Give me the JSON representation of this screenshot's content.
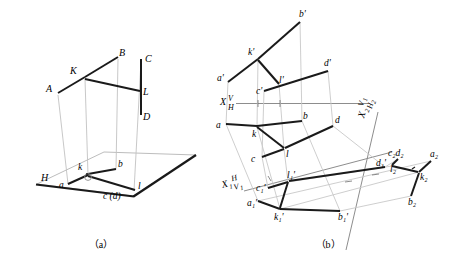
{
  "figure": {
    "type": "descriptive-geometry-projection-drawing",
    "caption_a": "（a）",
    "caption_b": "（b）",
    "bottom_caption": ""
  },
  "colors": {
    "heavy_line": "#1a1a1a",
    "thin_line": "#9a9a9a",
    "axis_line": "#8d8d8d",
    "plane_edge": "#b4b4b4",
    "text": "#1a1a1a"
  },
  "panel_a": {
    "name": "pictorial-view",
    "plane_label": "H",
    "space_points": [
      {
        "id": "A",
        "label": "A",
        "x": 52,
        "y": 88
      },
      {
        "id": "B",
        "label": "B",
        "x": 121,
        "y": 58
      },
      {
        "id": "K",
        "label": "K",
        "x": 77,
        "y": 73
      },
      {
        "id": "C",
        "label": "C",
        "x": 148,
        "y": 61
      },
      {
        "id": "L",
        "label": "L",
        "x": 145,
        "y": 92
      },
      {
        "id": "D",
        "label": "D",
        "x": 148,
        "y": 118
      }
    ],
    "space_segments": [
      {
        "name": "AK",
        "x1": 58,
        "y1": 93,
        "x2": 85,
        "y2": 77
      },
      {
        "name": "KB",
        "x1": 85,
        "y1": 77,
        "x2": 118,
        "y2": 57
      },
      {
        "name": "KL",
        "x1": 85,
        "y1": 79,
        "x2": 140,
        "y2": 91
      },
      {
        "name": "CD",
        "x1": 141,
        "y1": 59,
        "x2": 141,
        "y2": 115
      }
    ],
    "h_plane": {
      "pts": "37,184 104,152 196,155 133,196",
      "bottom_edge": "37,184 133,196"
    },
    "proj_points": [
      {
        "id": "a",
        "label": "a",
        "x": 64,
        "y": 185
      },
      {
        "id": "k",
        "label": "k",
        "x": 81,
        "y": 172
      },
      {
        "id": "b",
        "label": "b",
        "x": 119,
        "y": 168
      },
      {
        "id": "l",
        "label": "l",
        "x": 141,
        "y": 188
      },
      {
        "id": "cd",
        "label": "c (d)",
        "x": 113,
        "y": 198
      }
    ],
    "proj_segments": [
      {
        "name": "ak",
        "x1": 68,
        "y1": 184,
        "x2": 88,
        "y2": 175
      },
      {
        "name": "kb",
        "x1": 88,
        "y1": 174,
        "x2": 116,
        "y2": 169
      },
      {
        "name": "kl",
        "x1": 88,
        "y1": 176,
        "x2": 135,
        "y2": 190
      }
    ],
    "projectors": [
      {
        "x1": 58,
        "y1": 93,
        "x2": 68,
        "y2": 184
      },
      {
        "x1": 85,
        "y1": 77,
        "x2": 88,
        "y2": 175
      },
      {
        "x1": 118,
        "y1": 57,
        "x2": 116,
        "y2": 169
      },
      {
        "x1": 141,
        "y1": 59,
        "x2": 134,
        "y2": 191
      }
    ]
  },
  "panel_b": {
    "name": "orthographic-projection-view",
    "axes": [
      {
        "id": "x_vh",
        "label_x": "X",
        "label_top": "V",
        "label_bottom": "H",
        "lx": 228,
        "ly": 103
      },
      {
        "id": "x1_hv1",
        "label_x": "X",
        "sub": "1",
        "label_top": "H",
        "label_bottom": "V",
        "sub2": "1",
        "lx": 229,
        "ly": 185
      },
      {
        "id": "x2_v1h2",
        "label_x": "X",
        "sub": "2",
        "label_top": "V",
        "sub2": "1",
        "label_bottom": "H",
        "sub3": "2",
        "lx": 360,
        "ly": 128
      }
    ],
    "v_points": [
      {
        "id": "a_p",
        "label": "a'",
        "x": 222,
        "y": 78
      },
      {
        "id": "k_p",
        "label": "k'",
        "x": 253,
        "y": 52
      },
      {
        "id": "b_p",
        "label": "b'",
        "x": 303,
        "y": 15
      },
      {
        "id": "c_p",
        "label": "c'",
        "x": 262,
        "y": 88
      },
      {
        "id": "l_p",
        "label": "l'",
        "x": 283,
        "y": 79
      },
      {
        "id": "d_p",
        "label": "d'",
        "x": 326,
        "y": 65
      }
    ],
    "v_segments": [
      {
        "name": "a'k'",
        "x1": 228,
        "y1": 82,
        "x2": 258,
        "y2": 59
      },
      {
        "name": "k'b'",
        "x1": 258,
        "y1": 59,
        "x2": 300,
        "y2": 22
      },
      {
        "name": "k'l'",
        "x1": 258,
        "y1": 60,
        "x2": 278,
        "y2": 83
      },
      {
        "name": "c'd'",
        "x1": 264,
        "y1": 91,
        "x2": 328,
        "y2": 71
      }
    ],
    "h_points": [
      {
        "id": "a",
        "label": "a",
        "x": 220,
        "y": 126
      },
      {
        "id": "k",
        "label": "k",
        "x": 253,
        "y": 132
      },
      {
        "id": "b",
        "label": "b",
        "x": 305,
        "y": 118
      },
      {
        "id": "c",
        "label": "c",
        "x": 255,
        "y": 158
      },
      {
        "id": "l",
        "label": "l",
        "x": 285,
        "y": 153
      },
      {
        "id": "d",
        "label": "d",
        "x": 336,
        "y": 122
      }
    ],
    "h_segments": [
      {
        "name": "ak",
        "x1": 226,
        "y1": 124,
        "x2": 257,
        "y2": 126
      },
      {
        "name": "kb",
        "x1": 257,
        "y1": 126,
        "x2": 302,
        "y2": 121
      },
      {
        "name": "kl",
        "x1": 257,
        "y1": 127,
        "x2": 284,
        "y2": 148
      },
      {
        "name": "cl",
        "x1": 262,
        "y1": 157,
        "x2": 284,
        "y2": 149
      },
      {
        "name": "ld",
        "x1": 285,
        "y1": 148,
        "x2": 333,
        "y2": 126
      }
    ],
    "v1_points": [
      {
        "id": "a1_p",
        "label": "a₁'",
        "x": 253,
        "y": 203
      },
      {
        "id": "k1_p",
        "label": "k₁'",
        "x": 281,
        "y": 214
      },
      {
        "id": "b1_p",
        "label": "b₁'",
        "x": 341,
        "y": 215
      },
      {
        "id": "c1_p",
        "label": "c₁'",
        "x": 263,
        "y": 187
      },
      {
        "id": "l1_p",
        "label": "l₁'",
        "x": 290,
        "y": 176
      },
      {
        "id": "d1_p",
        "label": "d₁'",
        "x": 383,
        "y": 163
      }
    ],
    "v1_segments": [
      {
        "name": "a1'k1'",
        "x1": 258,
        "y1": 201,
        "x2": 280,
        "y2": 209
      },
      {
        "name": "k1'b1'",
        "x1": 280,
        "y1": 209,
        "x2": 340,
        "y2": 211
      },
      {
        "name": "k1'l1'",
        "x1": 280,
        "y1": 208,
        "x2": 288,
        "y2": 182
      },
      {
        "name": "c1'l1'",
        "x1": 268,
        "y1": 188,
        "x2": 288,
        "y2": 182
      },
      {
        "name": "l1'd1'",
        "x1": 289,
        "y1": 181,
        "x2": 385,
        "y2": 167
      }
    ],
    "h2_points": [
      {
        "id": "a2",
        "label": "a₂",
        "x": 434,
        "y": 157
      },
      {
        "id": "k2",
        "label": "k₂",
        "x": 424,
        "y": 175
      },
      {
        "id": "b2",
        "label": "b₂",
        "x": 411,
        "y": 200
      },
      {
        "id": "c2d2",
        "label": "c₂d₂",
        "x": 396,
        "y": 155
      },
      {
        "id": "l2",
        "label": "l₂",
        "x": 394,
        "y": 170
      }
    ],
    "h2_segments": [
      {
        "name": "a2k2",
        "x1": 431,
        "y1": 161,
        "x2": 419,
        "y2": 172
      },
      {
        "name": "k2b2",
        "x1": 419,
        "y1": 173,
        "x2": 411,
        "y2": 196
      },
      {
        "name": "k2l2",
        "x1": 418,
        "y1": 172,
        "x2": 392,
        "y2": 166
      },
      {
        "name": "l2cd",
        "x1": 392,
        "y1": 165,
        "x2": 398,
        "y2": 159
      }
    ]
  }
}
